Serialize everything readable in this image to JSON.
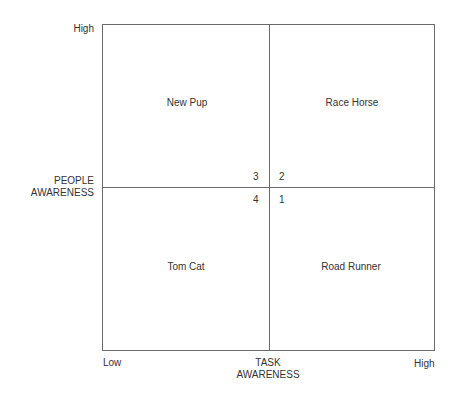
{
  "diagram": {
    "y_axis": {
      "title_line1": "PEOPLE",
      "title_line2": "AWARENESS",
      "high": "High"
    },
    "x_axis": {
      "title_line1": "TASK",
      "title_line2": "AWARENESS",
      "low": "Low",
      "high": "High"
    },
    "quadrants": [
      {
        "name": "New Pup",
        "number": "3",
        "position": "top-left"
      },
      {
        "name": "Race Horse",
        "number": "2",
        "position": "top-right"
      },
      {
        "name": "Tom Cat",
        "number": "4",
        "position": "bottom-left"
      },
      {
        "name": "Road Runner",
        "number": "1",
        "position": "bottom-right"
      }
    ]
  }
}
